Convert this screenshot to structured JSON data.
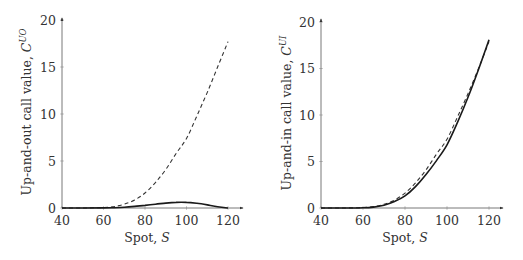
{
  "chart_data": [
    {
      "type": "line",
      "title": "",
      "xlabel": "Spot, S",
      "ylabel": "Up-and-out call value, C^UO",
      "ylabel_main": "Up-and-out call value, ",
      "ylabel_symbol": "C",
      "ylabel_superscript": "UO",
      "xlim": [
        40,
        125
      ],
      "ylim": [
        0,
        20
      ],
      "xticks": [
        40,
        60,
        80,
        100,
        120
      ],
      "yticks": [
        0,
        5,
        10,
        15,
        20
      ],
      "grid": false,
      "legend": null,
      "x": [
        40,
        50,
        60,
        65,
        70,
        75,
        80,
        85,
        90,
        95,
        100,
        105,
        110,
        115,
        120
      ],
      "series": [
        {
          "name": "solid",
          "style": "solid",
          "values": [
            0,
            0,
            0.01,
            0.03,
            0.08,
            0.17,
            0.28,
            0.4,
            0.52,
            0.6,
            0.6,
            0.5,
            0.33,
            0.14,
            0
          ]
        },
        {
          "name": "dashed",
          "style": "dashed",
          "values": [
            0,
            0,
            0.05,
            0.15,
            0.4,
            0.85,
            1.6,
            2.7,
            4.1,
            5.8,
            7.4,
            9.8,
            12.3,
            15.0,
            17.7
          ]
        }
      ]
    },
    {
      "type": "line",
      "title": "",
      "xlabel": "Spot, S",
      "ylabel": "Up-and-in call value, C^UI",
      "ylabel_main": "Up-and-in call value, ",
      "ylabel_symbol": "C",
      "ylabel_superscript": "UI",
      "xlim": [
        40,
        125
      ],
      "ylim": [
        0,
        20
      ],
      "xticks": [
        40,
        60,
        80,
        100,
        120
      ],
      "yticks": [
        0,
        5,
        10,
        15,
        20
      ],
      "grid": false,
      "legend": null,
      "x": [
        40,
        50,
        60,
        65,
        70,
        75,
        80,
        85,
        90,
        95,
        100,
        105,
        110,
        115,
        120
      ],
      "series": [
        {
          "name": "solid",
          "style": "solid",
          "values": [
            0,
            0,
            0.03,
            0.1,
            0.3,
            0.7,
            1.3,
            2.3,
            3.6,
            5.1,
            6.8,
            9.2,
            11.9,
            14.9,
            18.1
          ]
        },
        {
          "name": "dashed",
          "style": "dashed",
          "values": [
            0,
            0,
            0.05,
            0.15,
            0.4,
            0.85,
            1.6,
            2.7,
            4.1,
            5.8,
            7.4,
            9.8,
            12.3,
            15.0,
            17.9
          ]
        }
      ]
    }
  ]
}
